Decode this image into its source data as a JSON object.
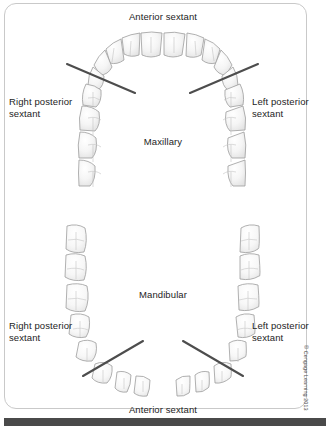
{
  "figure": {
    "labels": {
      "anterior_top": "Anterior sextant",
      "anterior_bottom": "Anterior sextant",
      "right_posterior_top": "Right posterior\nsextant",
      "left_posterior_top": "Left posterior\nsextant",
      "right_posterior_bottom": "Right posterior\nsextant",
      "left_posterior_bottom": "Left posterior\nsextant",
      "maxillary": "Maxillary",
      "mandibular": "Mandibular"
    },
    "copyright": "© Cengage Learning 2013",
    "colors": {
      "frame_border": "#c9c9c9",
      "background": "#ffffff",
      "tooth_outline": "#9a9a9a",
      "tooth_fill": "#f3f3f3",
      "divider_line": "#4d4d4d",
      "text": "#1d1d1d",
      "bottom_bar": "#4a4a4a"
    },
    "arches": [
      {
        "name": "maxillary",
        "sextants": [
          "right posterior",
          "anterior",
          "left posterior"
        ],
        "teeth_per_quadrant": 8
      },
      {
        "name": "mandibular",
        "sextants": [
          "right posterior",
          "anterior",
          "left posterior"
        ],
        "teeth_per_quadrant": 8
      }
    ],
    "divider_lines": 4
  }
}
